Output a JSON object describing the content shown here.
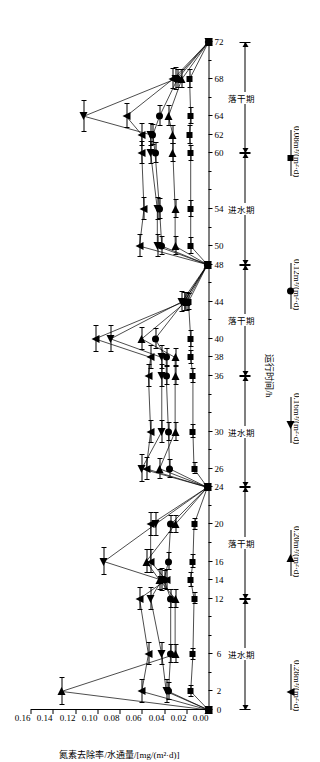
{
  "chart_data": {
    "type": "line",
    "title": "",
    "xlabel": "运行时间/h",
    "ylabel": "氮素去除率/水通量/[mg/(m²·d)]",
    "xlim": [
      0,
      72
    ],
    "ylim": [
      0.0,
      0.16
    ],
    "grid": false,
    "legend_position": "right",
    "x_ticks": [
      0,
      2,
      6,
      12,
      14,
      16,
      20,
      24,
      26,
      30,
      36,
      38,
      40,
      44,
      48,
      50,
      54,
      60,
      62,
      64,
      68,
      72
    ],
    "x_tick_labels": [
      "0",
      "2",
      "6",
      "12",
      "14",
      "16",
      "20",
      "24",
      "26",
      "30",
      "36",
      "38",
      "40",
      "44",
      "48",
      "50",
      "54",
      "60",
      "62",
      "64",
      "68",
      "72"
    ],
    "x_minor_ticks": [
      4,
      8,
      10,
      18,
      22,
      28,
      32,
      34,
      42,
      46,
      52,
      56,
      58,
      66,
      70
    ],
    "y_ticks": [
      0.0,
      0.02,
      0.04,
      0.06,
      0.08,
      0.1,
      0.12,
      0.14,
      0.16
    ],
    "y_tick_labels": [
      "0.00",
      "0.02",
      "0.04",
      "0.06",
      "0.08",
      "0.10",
      "0.12",
      "0.14",
      "0.16"
    ],
    "x": [
      0,
      2,
      6,
      12,
      14,
      16,
      20,
      24,
      26,
      30,
      36,
      38,
      40,
      44,
      48,
      50,
      54,
      60,
      62,
      64,
      68,
      72
    ],
    "series": [
      {
        "name": "0.08m³/(m²·d)",
        "marker": "square",
        "values": [
          0.0,
          0.016,
          0.014,
          0.013,
          0.016,
          0.014,
          0.013,
          0.001,
          0.013,
          0.014,
          0.014,
          0.016,
          0.016,
          0.018,
          0.001,
          0.016,
          0.016,
          0.016,
          0.017,
          0.016,
          0.017,
          0.0
        ],
        "errors": [
          0.0,
          0.005,
          0.005,
          0.005,
          0.006,
          0.006,
          0.005,
          0.002,
          0.005,
          0.006,
          0.006,
          0.006,
          0.007,
          0.007,
          0.002,
          0.007,
          0.007,
          0.007,
          0.008,
          0.007,
          0.008,
          0.0
        ]
      },
      {
        "name": "0.12m³/(m²·d)",
        "marker": "circle",
        "values": [
          0.0,
          0.036,
          0.034,
          0.034,
          0.04,
          0.036,
          0.034,
          0.001,
          0.035,
          0.036,
          0.038,
          0.038,
          0.048,
          0.022,
          0.001,
          0.042,
          0.044,
          0.048,
          0.05,
          0.044,
          0.028,
          0.0
        ],
        "errors": [
          0.0,
          0.008,
          0.008,
          0.008,
          0.008,
          0.008,
          0.008,
          0.002,
          0.008,
          0.008,
          0.008,
          0.008,
          0.009,
          0.008,
          0.002,
          0.008,
          0.009,
          0.009,
          0.009,
          0.009,
          0.008,
          0.0
        ]
      },
      {
        "name": "0.16m³/(m²·d)",
        "marker": "tri-left",
        "values": [
          0.0,
          0.038,
          0.042,
          0.052,
          0.042,
          0.094,
          0.048,
          0.001,
          0.06,
          0.042,
          0.042,
          0.042,
          0.088,
          0.024,
          0.001,
          0.046,
          0.046,
          0.052,
          0.052,
          0.112,
          0.03,
          0.0
        ],
        "errors": [
          0.0,
          0.01,
          0.01,
          0.01,
          0.01,
          0.012,
          0.01,
          0.002,
          0.012,
          0.01,
          0.01,
          0.01,
          0.012,
          0.009,
          0.002,
          0.01,
          0.01,
          0.01,
          0.01,
          0.014,
          0.01,
          0.0
        ]
      },
      {
        "name": "0.20m³/(m²·d)",
        "marker": "tri-right",
        "values": [
          0.0,
          0.132,
          0.03,
          0.03,
          0.044,
          0.056,
          0.03,
          0.001,
          0.044,
          0.03,
          0.03,
          0.03,
          0.06,
          0.02,
          0.001,
          0.03,
          0.03,
          0.032,
          0.032,
          0.036,
          0.024,
          0.0
        ],
        "errors": [
          0.0,
          0.012,
          0.008,
          0.008,
          0.009,
          0.01,
          0.008,
          0.002,
          0.009,
          0.008,
          0.008,
          0.008,
          0.01,
          0.008,
          0.002,
          0.008,
          0.008,
          0.008,
          0.008,
          0.009,
          0.008,
          0.0
        ]
      },
      {
        "name": "0.28m³/(m²·d)",
        "marker": "tri-up",
        "values": [
          0.0,
          0.06,
          0.054,
          0.062,
          0.038,
          0.052,
          0.052,
          0.001,
          0.056,
          0.052,
          0.054,
          0.052,
          0.102,
          0.022,
          0.001,
          0.062,
          0.058,
          0.06,
          0.06,
          0.074,
          0.032,
          0.0
        ],
        "errors": [
          0.0,
          0.01,
          0.01,
          0.01,
          0.009,
          0.01,
          0.01,
          0.002,
          0.01,
          0.01,
          0.01,
          0.01,
          0.012,
          0.008,
          0.002,
          0.01,
          0.01,
          0.01,
          0.01,
          0.011,
          0.009,
          0.0
        ]
      }
    ],
    "phases": [
      {
        "label": "进水期",
        "start": 0,
        "end": 12
      },
      {
        "label": "落干期",
        "start": 12,
        "end": 24
      },
      {
        "label": "进水期",
        "start": 24,
        "end": 36
      },
      {
        "label": "落干期",
        "start": 36,
        "end": 48
      },
      {
        "label": "进水期",
        "start": 48,
        "end": 60
      },
      {
        "label": "落干期",
        "start": 60,
        "end": 72
      }
    ]
  }
}
